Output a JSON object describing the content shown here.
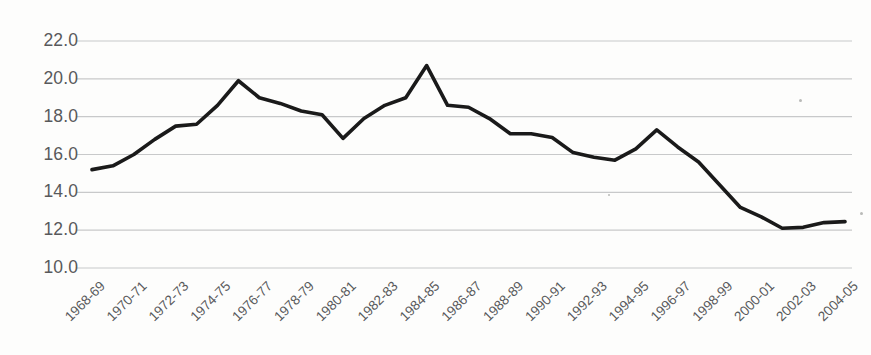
{
  "chart_data": {
    "type": "line",
    "title": "",
    "subtitle": "",
    "xlabel": "",
    "ylabel": "",
    "grid": true,
    "legend": false,
    "legend_position": "none",
    "line_color": "#1a1a1a",
    "grid_color": "#c8c9ca",
    "label_color": "#58595b",
    "background_color": "#fdfdfc",
    "ylim": [
      10.0,
      22.0
    ],
    "ytick_values": [
      22.0,
      20.0,
      18.0,
      16.0,
      14.0,
      12.0,
      10.0
    ],
    "ytick_labels": [
      "22.0",
      "20.0",
      "18.0",
      "16.0",
      "14.0",
      "12.0",
      "10.0"
    ],
    "xtick_labels": [
      "1968-69",
      "1970-71",
      "1972-73",
      "1974-75",
      "1976-77",
      "1978-79",
      "1980-81",
      "1982-83",
      "1984-85",
      "1986-87",
      "1988-89",
      "1990-91",
      "1992-93",
      "1994-95",
      "1996-97",
      "1998-99",
      "2000-01",
      "2002-03",
      "2004-05"
    ],
    "xtick_interval_years": 2,
    "categories": [
      "1968-69",
      "1969-70",
      "1970-71",
      "1971-72",
      "1972-73",
      "1973-74",
      "1974-75",
      "1975-76",
      "1976-77",
      "1977-78",
      "1978-79",
      "1979-80",
      "1980-81",
      "1981-82",
      "1982-83",
      "1983-84",
      "1984-85",
      "1985-86",
      "1986-87",
      "1987-88",
      "1988-89",
      "1989-90",
      "1990-91",
      "1991-92",
      "1992-93",
      "1993-94",
      "1994-95",
      "1995-96",
      "1996-97",
      "1997-98",
      "1998-99",
      "1999-00",
      "2000-01",
      "2001-02",
      "2002-03",
      "2003-04",
      "2004-05"
    ],
    "values": [
      15.2,
      15.4,
      16.0,
      16.8,
      17.5,
      17.6,
      18.6,
      19.9,
      19.0,
      18.7,
      18.3,
      18.1,
      16.85,
      17.9,
      18.6,
      19.0,
      20.7,
      18.6,
      18.5,
      17.9,
      17.1,
      17.1,
      16.9,
      16.1,
      15.85,
      15.7,
      16.3,
      17.3,
      16.4,
      15.6,
      14.4,
      13.2,
      12.7,
      12.1,
      12.15,
      12.4,
      12.45
    ],
    "series_name": "",
    "annotations": []
  }
}
